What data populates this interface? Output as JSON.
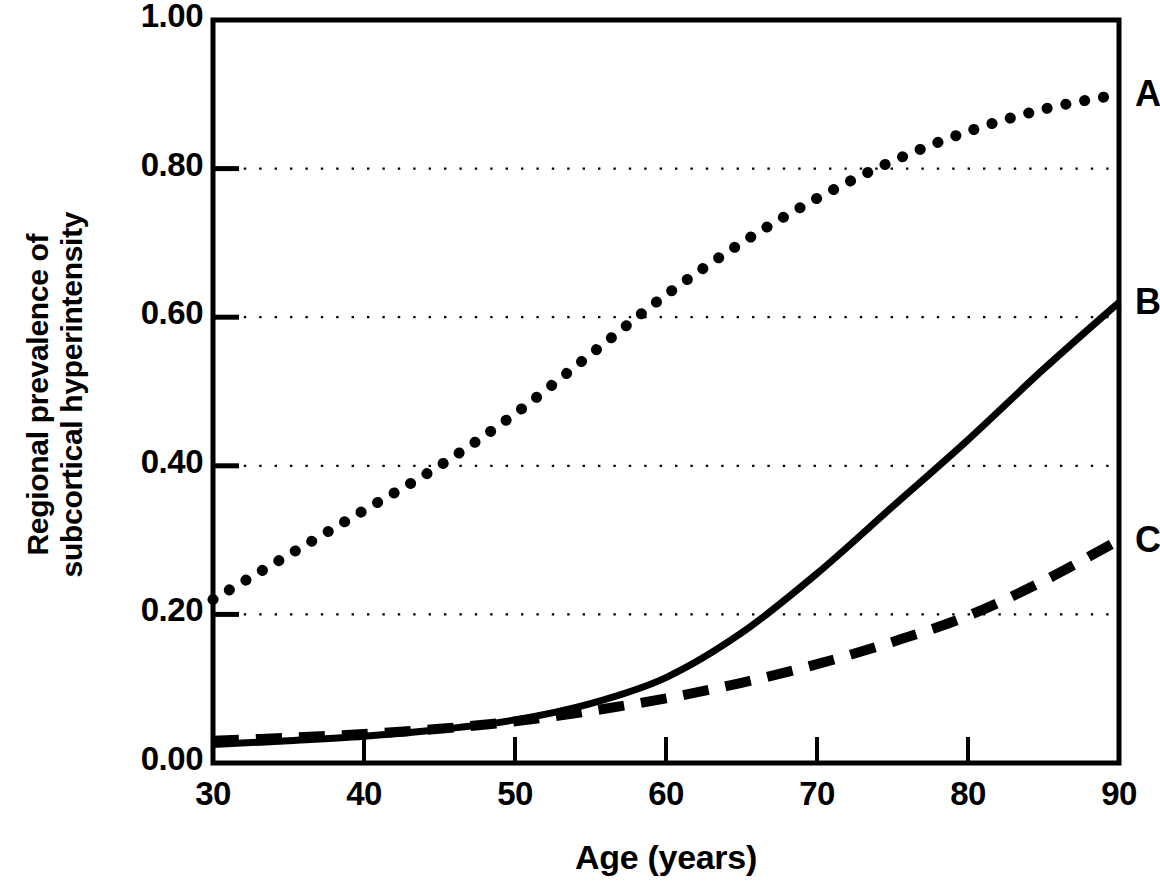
{
  "chart_data": {
    "type": "line",
    "title": "",
    "xlabel": "Age (years)",
    "ylabel_lines": [
      "Regional prevalence of",
      "subcortical hyperintensity"
    ],
    "xlim": [
      30,
      90
    ],
    "ylim": [
      0.0,
      1.0
    ],
    "xticks": [
      30,
      40,
      50,
      60,
      70,
      80,
      90
    ],
    "xtick_labels": [
      "30",
      "40",
      "50",
      "60",
      "70",
      "80",
      "90"
    ],
    "yticks": [
      0.0,
      0.2,
      0.4,
      0.6,
      0.8,
      1.0
    ],
    "ytick_labels": [
      "0.00",
      "0.20",
      "0.40",
      "0.60",
      "0.80",
      "1.00"
    ],
    "grid": "horizontal-dotted",
    "gridlines_at": [
      0.2,
      0.4,
      0.6,
      0.8
    ],
    "legend_position": "right-of-axis-end-labels",
    "x": [
      30,
      35,
      40,
      45,
      50,
      55,
      60,
      65,
      70,
      75,
      80,
      85,
      90
    ],
    "series": [
      {
        "name": "A",
        "label": "A",
        "style": "dotted",
        "color": "#000000",
        "values": [
          0.22,
          0.28,
          0.34,
          0.4,
          0.47,
          0.55,
          0.63,
          0.7,
          0.76,
          0.81,
          0.85,
          0.88,
          0.9
        ]
      },
      {
        "name": "B",
        "label": "B",
        "style": "solid",
        "color": "#000000",
        "values": [
          0.025,
          0.03,
          0.036,
          0.045,
          0.058,
          0.08,
          0.115,
          0.175,
          0.255,
          0.345,
          0.435,
          0.53,
          0.62
        ]
      },
      {
        "name": "C",
        "label": "C",
        "style": "dashed",
        "color": "#000000",
        "values": [
          0.03,
          0.034,
          0.039,
          0.046,
          0.056,
          0.07,
          0.087,
          0.108,
          0.133,
          0.163,
          0.198,
          0.245,
          0.3
        ]
      }
    ]
  },
  "axes": {
    "frame_color": "#000000",
    "background": "#ffffff"
  }
}
